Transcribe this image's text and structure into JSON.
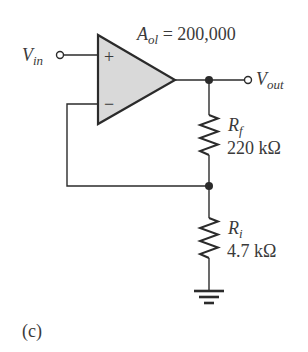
{
  "figure": {
    "caption": "(c)",
    "type": "non-inverting op-amp amplifier"
  },
  "opamp": {
    "gain_symbol": "A",
    "gain_subscript": "ol",
    "gain_equals": " = 200,000",
    "plus_sign": "+",
    "minus_sign": "−",
    "fill_color": "#d9d9d9"
  },
  "input": {
    "label": "V",
    "subscript": "in"
  },
  "output": {
    "label": "V",
    "subscript": "out"
  },
  "resistors": [
    {
      "name": "R",
      "subscript": "f",
      "value": "220 kΩ"
    },
    {
      "name": "R",
      "subscript": "i",
      "value": "4.7 kΩ"
    }
  ],
  "colors": {
    "wire": "#2b2b2b",
    "text": "#3a3a3a"
  }
}
